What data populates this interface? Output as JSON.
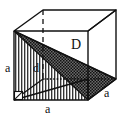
{
  "figure": {
    "kind": "geometry-diagram",
    "background_color": "#ffffff",
    "stroke_color": "#111111",
    "shading_color": "#4a4a4a",
    "hatch_color": "#2b2b2b"
  },
  "labels": {
    "space_diagonal": "D",
    "face_diagonal": "d",
    "edge_left": "a",
    "edge_bottom": "a",
    "edge_right": "a"
  },
  "geometry": {
    "front_face": {
      "top_left": [
        14,
        31
      ],
      "top_right": [
        88,
        31
      ],
      "bottom_left": [
        14,
        100
      ],
      "bottom_right": [
        88,
        100
      ]
    },
    "back_face": {
      "top_left": [
        43,
        10
      ],
      "top_right": [
        116,
        10
      ],
      "bottom_left": [
        43,
        79
      ],
      "bottom_right": [
        116,
        79
      ]
    },
    "shaded_triangle": [
      [
        14,
        31
      ],
      [
        116,
        79
      ],
      [
        88,
        100
      ]
    ],
    "hatched_region": [
      [
        14,
        31
      ],
      [
        88,
        100
      ],
      [
        14,
        100
      ]
    ],
    "hidden_edges": [
      [
        [
          43,
          10
        ],
        [
          43,
          79
        ]
      ],
      [
        [
          43,
          79
        ],
        [
          14,
          100
        ]
      ],
      [
        [
          43,
          79
        ],
        [
          116,
          79
        ]
      ]
    ],
    "right_angle_marker": {
      "corner": [
        14,
        100
      ],
      "size": 8
    }
  }
}
